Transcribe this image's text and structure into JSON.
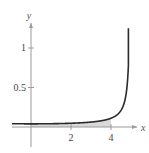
{
  "chart_data": {
    "type": "line",
    "title": "",
    "xlabel": "x",
    "ylabel": "y",
    "xlim": [
      -1.0,
      5.6
    ],
    "ylim": [
      -0.35,
      1.4
    ],
    "x_ticks": [
      2,
      4
    ],
    "x_tick_labels": [
      "2",
      "4"
    ],
    "y_ticks": [
      0.5,
      1
    ],
    "y_tick_labels": [
      "0.5",
      "1"
    ],
    "grid": false,
    "legend": null,
    "series": [
      {
        "name": "f(x)",
        "x": [
          -0.95,
          0,
          1,
          2,
          3,
          3.5,
          4,
          4.3,
          4.5,
          4.65,
          4.75,
          4.82,
          4.87
        ],
        "values": [
          0.041,
          0.04,
          0.042,
          0.048,
          0.063,
          0.078,
          0.111,
          0.153,
          0.211,
          0.288,
          0.368,
          0.54,
          1.25
        ]
      }
    ],
    "shaded_region": {
      "x_from": 0,
      "x_to": 4,
      "description": "area under curve between x=0 and x=4"
    },
    "annotations": []
  },
  "header": {
    "cropped_text": ""
  },
  "colors": {
    "curve": "#2b2b2b",
    "axis": "#9a9a9a",
    "shade": "#d9d9d9"
  }
}
